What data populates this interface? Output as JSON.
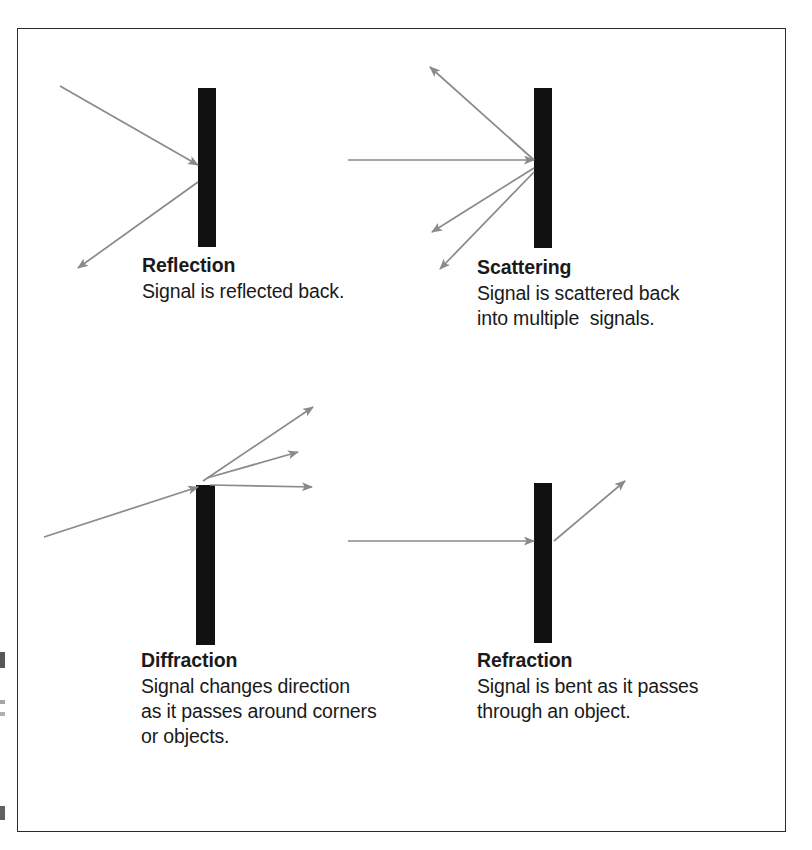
{
  "figure": {
    "background_color": "#ffffff",
    "frame_color": "#2b2b2b",
    "bar_color": "#111111",
    "ray_color": "#8a8a8a",
    "text_color": "#1a1a1a"
  },
  "panels": [
    {
      "id": "reflection",
      "title": "Reflection",
      "body": "Signal is reflected back.",
      "barrier_label": "vertical-barrier",
      "rays": [
        {
          "name": "incoming-ray",
          "from": [
            60,
            86
          ],
          "to": [
            198,
            165
          ],
          "arrow": "end"
        },
        {
          "name": "reflected-ray",
          "from": [
            198,
            182
          ],
          "to": [
            78,
            268
          ],
          "arrow": "end"
        }
      ]
    },
    {
      "id": "scattering",
      "title": "Scattering",
      "body": "Signal is scattered back\ninto multiple  signals.",
      "barrier_label": "vertical-barrier",
      "rays": [
        {
          "name": "incoming-ray",
          "from": [
            348,
            160
          ],
          "to": [
            534,
            160
          ],
          "arrow": "end"
        },
        {
          "name": "scattered-ray-up",
          "from": [
            534,
            160
          ],
          "to": [
            430,
            67
          ],
          "arrow": "end"
        },
        {
          "name": "scattered-ray-mid",
          "from": [
            534,
            168
          ],
          "to": [
            432,
            232
          ],
          "arrow": "end"
        },
        {
          "name": "scattered-ray-low",
          "from": [
            534,
            172
          ],
          "to": [
            440,
            269
          ],
          "arrow": "end"
        }
      ]
    },
    {
      "id": "diffraction",
      "title": "Diffraction",
      "body": "Signal changes direction\nas it passes around corners\nor objects.",
      "barrier_label": "vertical-barrier",
      "rays": [
        {
          "name": "incoming-ray",
          "from": [
            44,
            537
          ],
          "to": [
            196,
            487
          ],
          "arrow": "end"
        },
        {
          "name": "diffracted-ray-up",
          "from": [
            203,
            481
          ],
          "to": [
            313,
            407
          ],
          "arrow": "end"
        },
        {
          "name": "diffracted-ray-mid",
          "from": [
            207,
            478
          ],
          "to": [
            298,
            452
          ],
          "arrow": "end"
        },
        {
          "name": "diffracted-ray-low",
          "from": [
            210,
            485
          ],
          "to": [
            312,
            487
          ],
          "arrow": "end"
        }
      ]
    },
    {
      "id": "refraction",
      "title": "Refraction",
      "body": "Signal is bent as it passes\nthrough an object.",
      "barrier_label": "vertical-barrier",
      "rays": [
        {
          "name": "incoming-ray",
          "from": [
            348,
            541
          ],
          "to": [
            534,
            541
          ],
          "arrow": "end"
        },
        {
          "name": "bent-ray",
          "from": [
            554,
            541
          ],
          "to": [
            625,
            481
          ],
          "arrow": "end"
        }
      ]
    }
  ],
  "barriers": [
    {
      "name": "reflection-barrier",
      "x": 198,
      "y": 88,
      "width": 18,
      "height": 159
    },
    {
      "name": "scattering-barrier",
      "x": 534,
      "y": 88,
      "width": 18,
      "height": 160
    },
    {
      "name": "diffraction-barrier",
      "x": 196,
      "y": 485,
      "width": 19,
      "height": 160
    },
    {
      "name": "refraction-barrier",
      "x": 534,
      "y": 483,
      "width": 18,
      "height": 160
    }
  ]
}
